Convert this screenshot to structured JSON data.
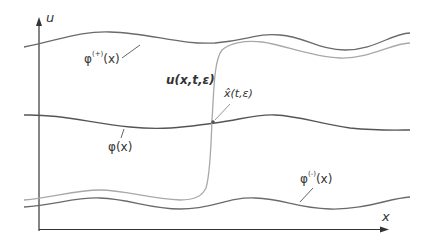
{
  "diagram": {
    "axes": {
      "y_label": "u",
      "x_label": "x"
    },
    "labels": {
      "phi_plus": "φ⁽⁺⁾(x)",
      "phi_plus_base": "φ",
      "phi_plus_sup": "(+)",
      "phi_plus_arg": "(x)",
      "u_solution": "u(x,t,ε)",
      "x_hat": "x̂(t,ε)",
      "phi": "φ(x)",
      "phi_minus_base": "φ",
      "phi_minus_sup": "(-)",
      "phi_minus_arg": "(x)"
    },
    "curves": [
      {
        "name": "phi-plus",
        "description": "upper stable branch φ^(+)(x)"
      },
      {
        "name": "phi",
        "description": "middle unstable root φ(x)"
      },
      {
        "name": "phi-minus",
        "description": "lower stable branch φ^(-)(x)"
      },
      {
        "name": "u-solution",
        "description": "contrast structure u(x,t,ε) with sharp transition at x̂(t,ε)"
      }
    ],
    "colors": {
      "axis": "#333333",
      "curve_dark": "#6a6a6a",
      "curve_light": "#a8a8a8",
      "text": "#333333"
    }
  }
}
